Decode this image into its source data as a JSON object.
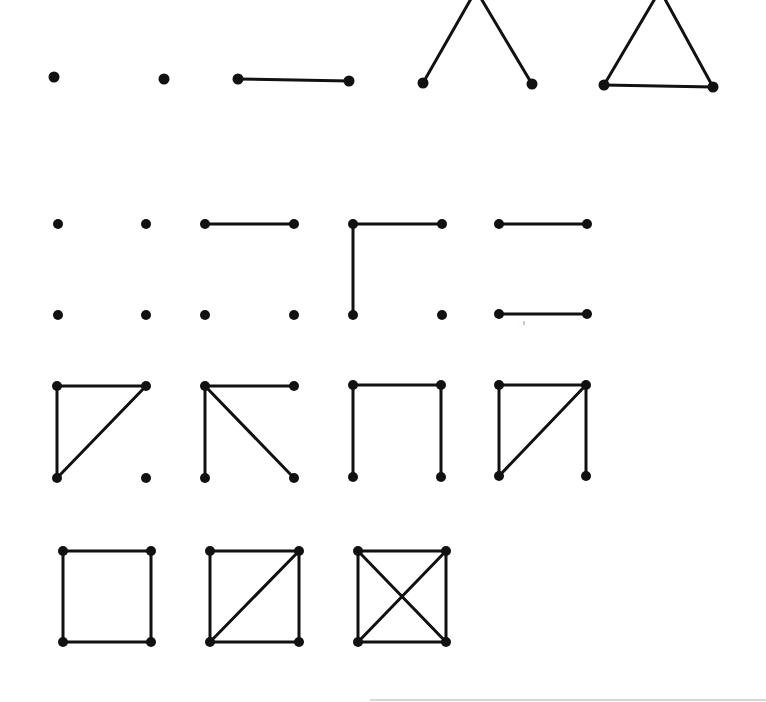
{
  "diagram": {
    "colors": {
      "ink": "#111111",
      "background": "#ffffff"
    },
    "graphs": [
      {
        "id": "g3-0",
        "row": 1,
        "edges": 0,
        "nodes": [
          [
            54,
            77
          ],
          [
            164,
            79
          ]
        ],
        "edge_list": []
      },
      {
        "id": "g3-1",
        "row": 1,
        "edges": 1,
        "nodes": [
          [
            238,
            79
          ],
          [
            349,
            81
          ]
        ],
        "edge_list": [
          [
            0,
            1
          ]
        ]
      },
      {
        "id": "g3-2",
        "row": 1,
        "edges": 2,
        "nodes": [
          [
            423,
            83
          ],
          [
            532,
            84
          ],
          [
            476,
            -10
          ]
        ],
        "edge_list": [
          [
            0,
            2
          ],
          [
            1,
            2
          ]
        ]
      },
      {
        "id": "g3-3",
        "row": 1,
        "edges": 3,
        "nodes": [
          [
            604,
            85
          ],
          [
            713,
            87
          ],
          [
            660,
            -10
          ]
        ],
        "edge_list": [
          [
            0,
            2
          ],
          [
            1,
            2
          ],
          [
            0,
            1
          ]
        ]
      },
      {
        "id": "g4-0",
        "row": 2,
        "edges": 0,
        "nodes": [
          [
            58,
            224
          ],
          [
            146,
            224
          ],
          [
            146,
            315
          ],
          [
            58,
            315
          ]
        ],
        "edge_list": []
      },
      {
        "id": "g4-1",
        "row": 2,
        "edges": 1,
        "nodes": [
          [
            205,
            224
          ],
          [
            294,
            224
          ],
          [
            294,
            315
          ],
          [
            205,
            315
          ]
        ],
        "edge_list": [
          [
            0,
            1
          ]
        ]
      },
      {
        "id": "g4-2a",
        "row": 2,
        "edges": 2,
        "nodes": [
          [
            353,
            224
          ],
          [
            442,
            224
          ],
          [
            442,
            315
          ],
          [
            353,
            315
          ]
        ],
        "edge_list": [
          [
            0,
            1
          ],
          [
            0,
            3
          ]
        ]
      },
      {
        "id": "g4-2b",
        "row": 2,
        "edges": 2,
        "nodes": [
          [
            499,
            224
          ],
          [
            587,
            224
          ],
          [
            587,
            314
          ],
          [
            499,
            314
          ]
        ],
        "edge_list": [
          [
            0,
            1
          ],
          [
            3,
            2
          ]
        ]
      },
      {
        "id": "g4-3a",
        "row": 3,
        "edges": 3,
        "nodes": [
          [
            57,
            386
          ],
          [
            146,
            386
          ],
          [
            146,
            478
          ],
          [
            57,
            478
          ]
        ],
        "edge_list": [
          [
            0,
            1
          ],
          [
            0,
            3
          ],
          [
            1,
            3
          ]
        ]
      },
      {
        "id": "g4-3b",
        "row": 3,
        "edges": 3,
        "nodes": [
          [
            205,
            386
          ],
          [
            294,
            386
          ],
          [
            294,
            478
          ],
          [
            205,
            478
          ]
        ],
        "edge_list": [
          [
            0,
            1
          ],
          [
            0,
            3
          ],
          [
            0,
            2
          ]
        ]
      },
      {
        "id": "g4-3c",
        "row": 3,
        "edges": 3,
        "nodes": [
          [
            353,
            385
          ],
          [
            441,
            385
          ],
          [
            441,
            477
          ],
          [
            353,
            477
          ]
        ],
        "edge_list": [
          [
            0,
            1
          ],
          [
            0,
            3
          ],
          [
            1,
            2
          ]
        ]
      },
      {
        "id": "g4-4",
        "row": 3,
        "edges": 4,
        "nodes": [
          [
            499,
            385
          ],
          [
            586,
            385
          ],
          [
            586,
            476
          ],
          [
            499,
            476
          ]
        ],
        "edge_list": [
          [
            0,
            1
          ],
          [
            0,
            3
          ],
          [
            1,
            3
          ],
          [
            1,
            2
          ]
        ]
      },
      {
        "id": "g4-4c",
        "row": 4,
        "edges": 4,
        "nodes": [
          [
            63,
            551
          ],
          [
            151,
            551
          ],
          [
            151,
            642
          ],
          [
            63,
            642
          ]
        ],
        "edge_list": [
          [
            0,
            1
          ],
          [
            1,
            2
          ],
          [
            2,
            3
          ],
          [
            3,
            0
          ]
        ]
      },
      {
        "id": "g4-5",
        "row": 4,
        "edges": 5,
        "nodes": [
          [
            210,
            551
          ],
          [
            299,
            551
          ],
          [
            299,
            642
          ],
          [
            210,
            642
          ]
        ],
        "edge_list": [
          [
            0,
            1
          ],
          [
            1,
            2
          ],
          [
            2,
            3
          ],
          [
            3,
            0
          ],
          [
            1,
            3
          ]
        ]
      },
      {
        "id": "g4-6",
        "row": 4,
        "edges": 6,
        "nodes": [
          [
            358,
            551
          ],
          [
            446,
            551
          ],
          [
            446,
            642
          ],
          [
            358,
            642
          ]
        ],
        "edge_list": [
          [
            0,
            1
          ],
          [
            1,
            2
          ],
          [
            2,
            3
          ],
          [
            3,
            0
          ],
          [
            1,
            3
          ],
          [
            0,
            2
          ]
        ]
      }
    ],
    "stray_mark": {
      "x": 523,
      "y": 325,
      "text": "ı"
    }
  }
}
